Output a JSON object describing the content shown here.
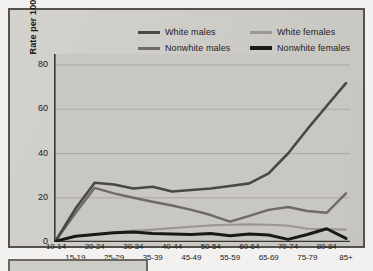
{
  "chart_data": {
    "type": "line",
    "title": "",
    "xlabel": "",
    "ylabel": "Rate per 100,000 Population",
    "categories": [
      "10-14",
      "15-19",
      "20-24",
      "25-29",
      "30-34",
      "35-39",
      "40-44",
      "45-49",
      "50-54",
      "55-59",
      "60-64",
      "65-69",
      "70-74",
      "75-79",
      "80-84",
      "85+"
    ],
    "ylim": [
      0,
      85
    ],
    "yticks": [
      0,
      20,
      40,
      60,
      80
    ],
    "grid": true,
    "legend_position": "top",
    "series": [
      {
        "name": "White males",
        "color": "#4a4845",
        "width": 2.6,
        "values": [
          0.8,
          15.0,
          26.8,
          26.0,
          24.2,
          25.0,
          22.8,
          23.5,
          24.2,
          25.3,
          26.5,
          31.0,
          40.0,
          51.0,
          61.5,
          71.8
        ]
      },
      {
        "name": "Nonwhite males",
        "color": "#6e6b66",
        "width": 2.4,
        "values": [
          0.8,
          13.0,
          24.5,
          22.0,
          20.0,
          18.2,
          16.5,
          14.5,
          12.2,
          9.2,
          11.8,
          14.5,
          15.8,
          14.0,
          13.2,
          22.0
        ]
      },
      {
        "name": "White females",
        "color": "#9c9994",
        "width": 2.2,
        "values": [
          0.5,
          2.5,
          3.5,
          4.4,
          5.0,
          5.6,
          6.3,
          6.9,
          7.5,
          7.8,
          8.0,
          7.8,
          7.4,
          6.0,
          5.8,
          5.6
        ]
      },
      {
        "name": "Nonwhite females",
        "color": "#1b1917",
        "width": 3.0,
        "values": [
          0.4,
          2.6,
          3.4,
          4.2,
          4.5,
          3.8,
          3.6,
          3.4,
          3.8,
          2.8,
          3.6,
          3.2,
          1.2,
          3.4,
          6.0,
          1.6
        ]
      }
    ]
  },
  "legend": {
    "entries": [
      {
        "label": "White males",
        "color": "#4a4845",
        "row": 0,
        "col": 0
      },
      {
        "label": "White females",
        "color": "#9c9994",
        "row": 0,
        "col": 1
      },
      {
        "label": "Nonwhite males",
        "color": "#6e6b66",
        "row": 1,
        "col": 0
      },
      {
        "label": "Nonwhite females",
        "color": "#1b1917",
        "row": 1,
        "col": 1
      }
    ]
  },
  "colors": {
    "figure_background": "#f2f1ef",
    "panel_background": "#cfcdc8",
    "frame_border": "#55524e",
    "grid": "#a9a6a1",
    "axis": "#3a3835",
    "text": "#1c1a19"
  }
}
